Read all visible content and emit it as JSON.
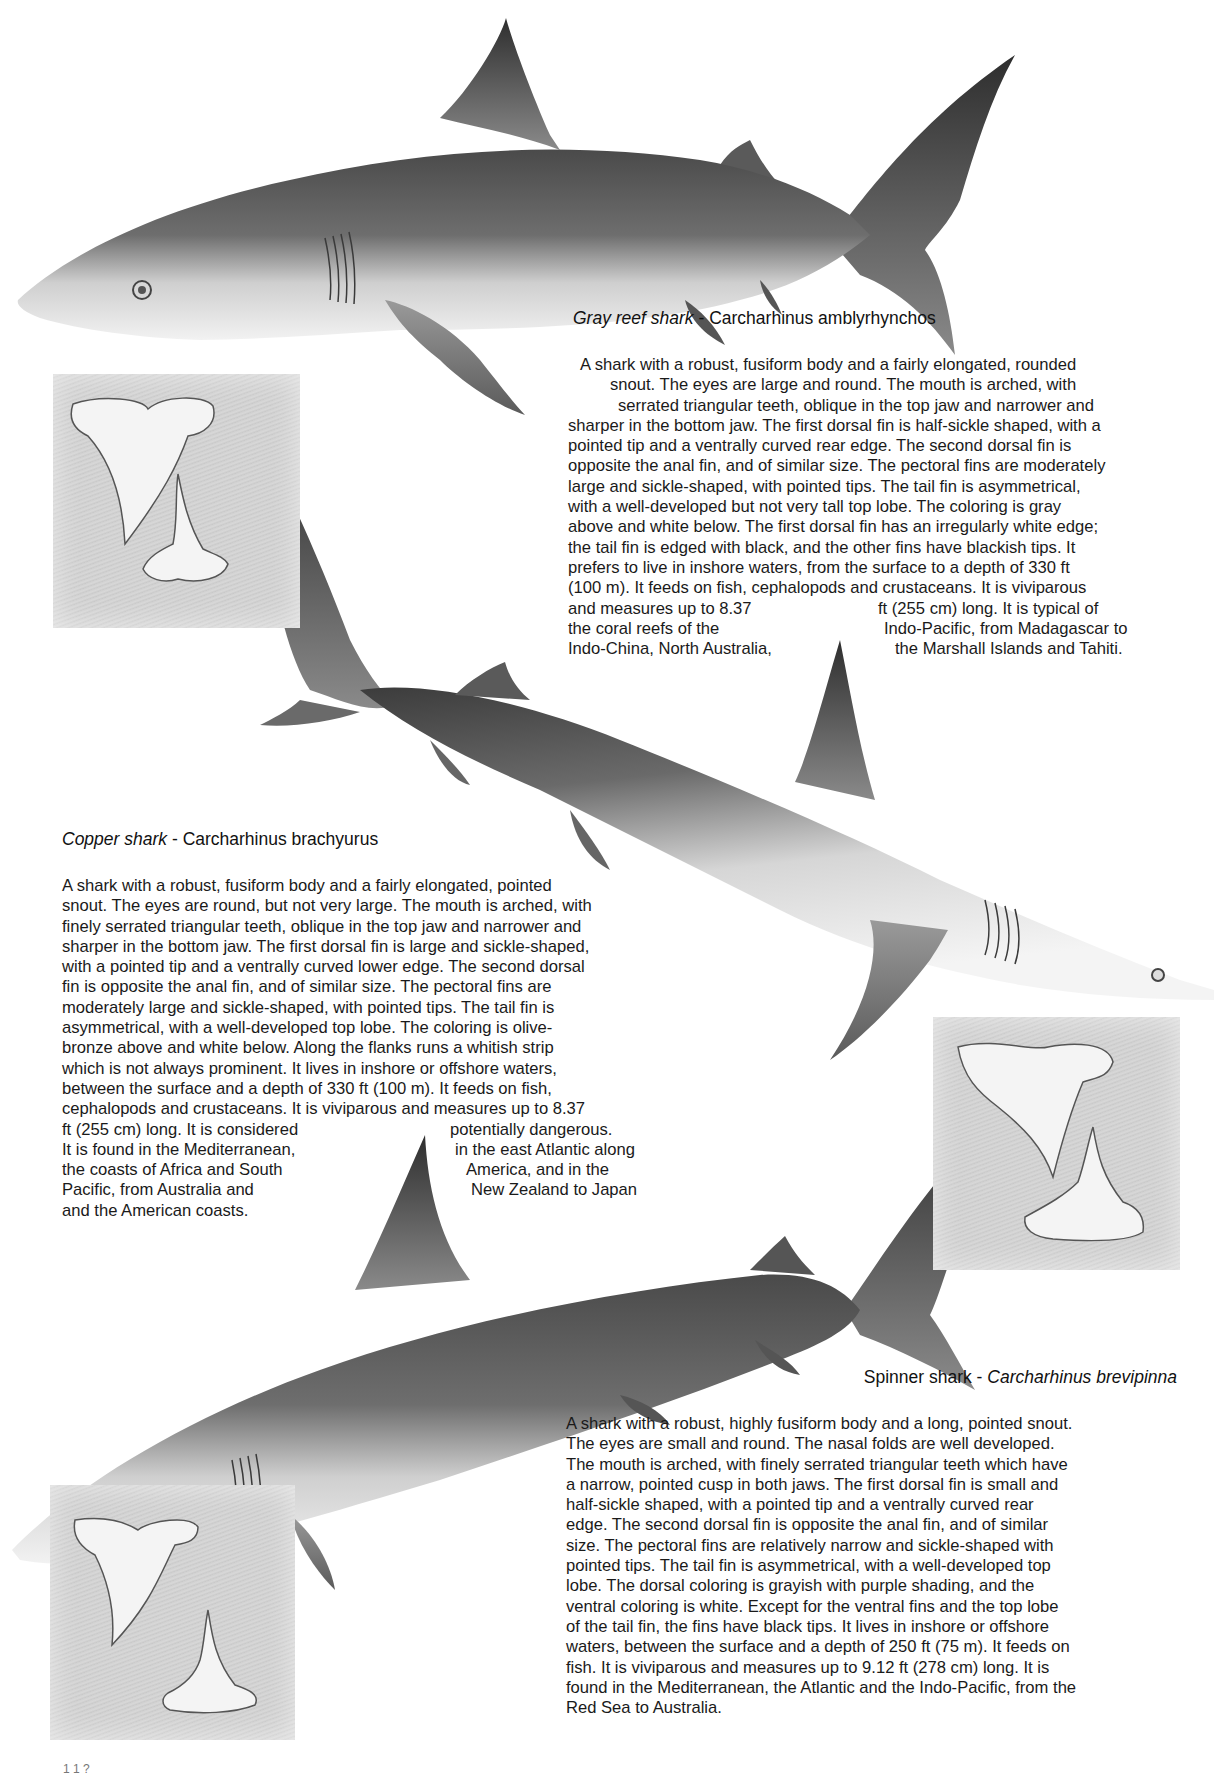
{
  "page": {
    "page_number_partial": "1 1 ?",
    "background": "#ffffff"
  },
  "sharks": {
    "gray_reef": {
      "common_name": "Gray reef shark",
      "separator": " - ",
      "scientific_name": "Carcharhinus amblyrhynchos",
      "lines": [
        "A shark with a robust, fusiform body and a fairly elongated, rounded",
        "snout. The eyes are large and round. The mouth is arched, with",
        "serrated triangular teeth, oblique in the top jaw and narrower and",
        "sharper in the bottom jaw. The first dorsal fin is half-sickle shaped, with a",
        "pointed tip and a ventrally curved rear edge. The second dorsal fin is",
        "opposite the anal fin, and of similar size. The pectoral fins are moderately",
        "large and sickle-shaped, with pointed tips. The tail fin is asymmetrical,",
        "with a well-developed but not very tall top lobe. The coloring is gray",
        "above and white below. The first dorsal fin has an irregularly white edge;",
        "the tail fin is edged with black, and the other fins have blackish tips. It",
        "prefers to live in inshore waters, from the surface to a depth of 330 ft",
        "(100 m). It feeds on fish, cephalopods and crustaceans. It is viviparous"
      ],
      "split_lines": [
        {
          "left": "and measures up to 8.37",
          "right": "ft (255 cm) long. It is typical of"
        },
        {
          "left": "the coral reefs of the",
          "right": "Indo-Pacific, from Madagascar to"
        },
        {
          "left": "Indo-China, North Australia,",
          "right": "the Marshall Islands and Tahiti."
        }
      ]
    },
    "copper": {
      "common_name": "Copper shark",
      "separator": " - ",
      "scientific_name": "Carcharhinus brachyurus",
      "lines": [
        "A shark with a robust, fusiform body and a fairly elongated, pointed",
        "snout. The eyes are round, but not very large. The mouth is arched, with",
        "finely serrated triangular teeth, oblique in the top jaw and narrower and",
        "sharper in the bottom jaw. The first dorsal fin is large and sickle-shaped,",
        "with a pointed tip and a ventrally curved lower edge. The second dorsal",
        "fin is opposite the anal fin, and of similar size. The pectoral fins are",
        "moderately large and sickle-shaped, with pointed tips. The tail fin is",
        "asymmetrical, with a well-developed top lobe. The coloring is olive-",
        "bronze above and white below. Along the flanks runs a whitish strip",
        "which is not always prominent. It lives in inshore or offshore waters,",
        "between the surface and a depth of 330 ft (100 m). It feeds on fish,",
        "cephalopods and crustaceans. It is viviparous and measures up to 8.37"
      ],
      "split_lines": [
        {
          "left": "ft (255 cm) long. It is considered",
          "right": "potentially dangerous."
        },
        {
          "left": "It is found in the Mediterranean,",
          "right": "in the east Atlantic along"
        },
        {
          "left": "the coasts of Africa and South",
          "right": "America, and in the"
        },
        {
          "left": "Pacific, from Australia and",
          "right": "New Zealand to Japan"
        },
        {
          "left": "and the American coasts.",
          "right": ""
        }
      ]
    },
    "spinner": {
      "common_name": "Spinner shark",
      "separator": " - ",
      "scientific_name": "Carcharhinus brevipinna",
      "lines": [
        "A shark with a robust, highly fusiform body and a long, pointed snout.",
        "The eyes are small and round. The nasal folds are well developed.",
        "The mouth is arched, with finely serrated triangular teeth which have",
        "a narrow, pointed cusp in both jaws. The first dorsal fin is small and",
        "half-sickle shaped, with a pointed tip and a ventrally curved rear",
        "edge. The second dorsal fin is opposite the anal fin, and of similar",
        "size. The pectoral fins are relatively narrow and sickle-shaped with",
        "pointed tips. The tail fin is asymmetrical, with a well-developed top",
        "lobe. The dorsal coloring is grayish with purple shading, and the",
        "ventral coloring is white. Except for the ventral fins and the top lobe",
        "of the tail fin, the fins have black tips. It lives in inshore or offshore",
        "waters, between the surface and a depth of 250 ft (75 m). It feeds on",
        "fish. It is viviparous and measures up to 9.12 ft (278 cm) long. It is",
        "found in the Mediterranean, the Atlantic and the Indo-Pacific, from the",
        "Red Sea to Australia."
      ]
    }
  },
  "illustrations": {
    "gray_reef_shark": "gray-reef-shark-illustration",
    "copper_shark": "copper-shark-illustration",
    "spinner_shark": "spinner-shark-illustration",
    "tooth_panels": [
      "gray-reef-teeth",
      "copper-teeth",
      "spinner-teeth"
    ]
  }
}
